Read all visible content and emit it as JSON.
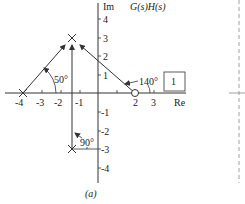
{
  "diagram": {
    "title": "G(s)H(s)",
    "caption": "(a)",
    "axes": {
      "real_label": "Re",
      "imag_label": "Im",
      "real_ticks": [
        "-4",
        "-3",
        "-2",
        "-1",
        "2",
        "3"
      ],
      "imag_ticks": [
        "4",
        "3",
        "2",
        "1",
        "-1",
        "-2",
        "-3",
        "-4"
      ]
    },
    "poles": [
      {
        "re": -4,
        "im": 0
      },
      {
        "re": -1.5,
        "im": 3
      },
      {
        "re": -1.5,
        "im": -3
      }
    ],
    "zeros": [
      {
        "re": 2,
        "im": 0
      }
    ],
    "test_point": {
      "re": -1.5,
      "im": 3
    },
    "angles": {
      "from_pole_minus4": "50°",
      "from_pole_lower": "90°",
      "from_zero_2": "140°"
    },
    "gain_box": "1"
  }
}
